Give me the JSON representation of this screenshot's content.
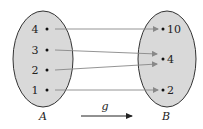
{
  "diagram": {
    "function_name": "g",
    "domain_set": {
      "label": "A",
      "elements": [
        "4",
        "3",
        "2",
        "1"
      ]
    },
    "codomain_set": {
      "label": "B",
      "elements": [
        "10",
        "4",
        "2"
      ]
    },
    "mappings": [
      {
        "from": "4",
        "to": "10"
      },
      {
        "from": "3",
        "to": "4"
      },
      {
        "from": "2",
        "to": "4"
      },
      {
        "from": "1",
        "to": "2"
      }
    ],
    "colors": {
      "set_fill": "#d9d9d9",
      "set_stroke": "#333333",
      "arrow": "#888888",
      "text": "#222222"
    }
  }
}
